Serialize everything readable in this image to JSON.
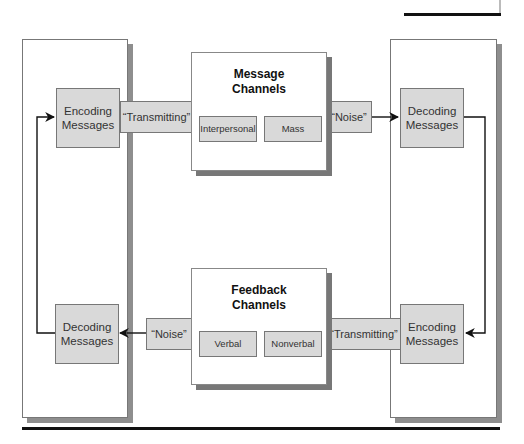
{
  "diagram": {
    "type": "communication-process-model",
    "left_panel": {
      "top_box": {
        "line1": "Encoding",
        "line2": "Messages"
      },
      "bottom_box": {
        "line1": "Decoding",
        "line2": "Messages"
      }
    },
    "right_panel": {
      "top_box": {
        "line1": "Decoding",
        "line2": "Messages"
      },
      "bottom_box": {
        "line1": "Encoding",
        "line2": "Messages"
      }
    },
    "message_channels": {
      "title_line1": "Message",
      "title_line2": "Channels",
      "items": [
        {
          "label": "Interpersonal"
        },
        {
          "label": "Mass"
        }
      ]
    },
    "feedback_channels": {
      "title_line1": "Feedback",
      "title_line2": "Channels",
      "items": [
        {
          "label": "Verbal"
        },
        {
          "label": "Nonverbal"
        }
      ]
    },
    "connectors": {
      "top_left_bar": "“Transmitting”",
      "top_right_bar": "“Noise”",
      "bottom_left_bar": "“Noise”",
      "bottom_right_bar": "“Transmitting”"
    },
    "colors": {
      "box_fill": "#d9d9d9",
      "border": "#777777",
      "shadow": "#8e8e8e",
      "rule": "#111111",
      "arrow": "#111111"
    }
  }
}
